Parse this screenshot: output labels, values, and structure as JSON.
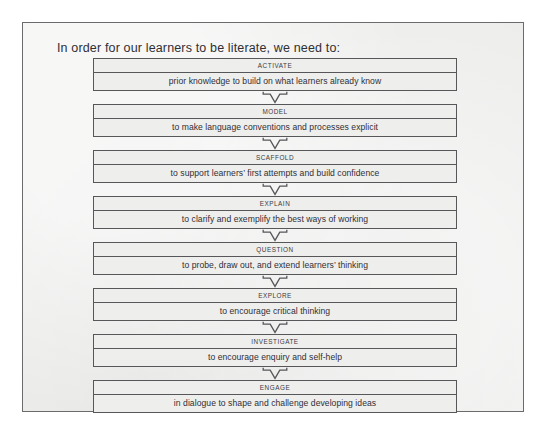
{
  "page": {
    "heading": "In order for our learners to be literate, we need to:",
    "background_color": "#ededec",
    "border_color": "#6b6b6b",
    "text_color": "#2f2f35"
  },
  "flow": {
    "connector_icon": "down-arrow-icon",
    "steps": [
      {
        "title": "ACTIVATE",
        "description": "prior knowledge to build on what learners already know"
      },
      {
        "title": "MODEL",
        "description": "to make language conventions and processes explicit"
      },
      {
        "title": "SCAFFOLD",
        "description": "to support learners’ first attempts and build confidence"
      },
      {
        "title": "EXPLAIN",
        "description": "to clarify and exemplify the best ways of working"
      },
      {
        "title": "QUESTION",
        "description": "to probe, draw out, and extend learners’ thinking"
      },
      {
        "title": "EXPLORE",
        "description": "to encourage critical thinking"
      },
      {
        "title": "INVESTIGATE",
        "description": "to encourage enquiry and self-help"
      },
      {
        "title": "ENGAGE",
        "description": "in dialogue to shape and challenge developing ideas"
      }
    ]
  }
}
